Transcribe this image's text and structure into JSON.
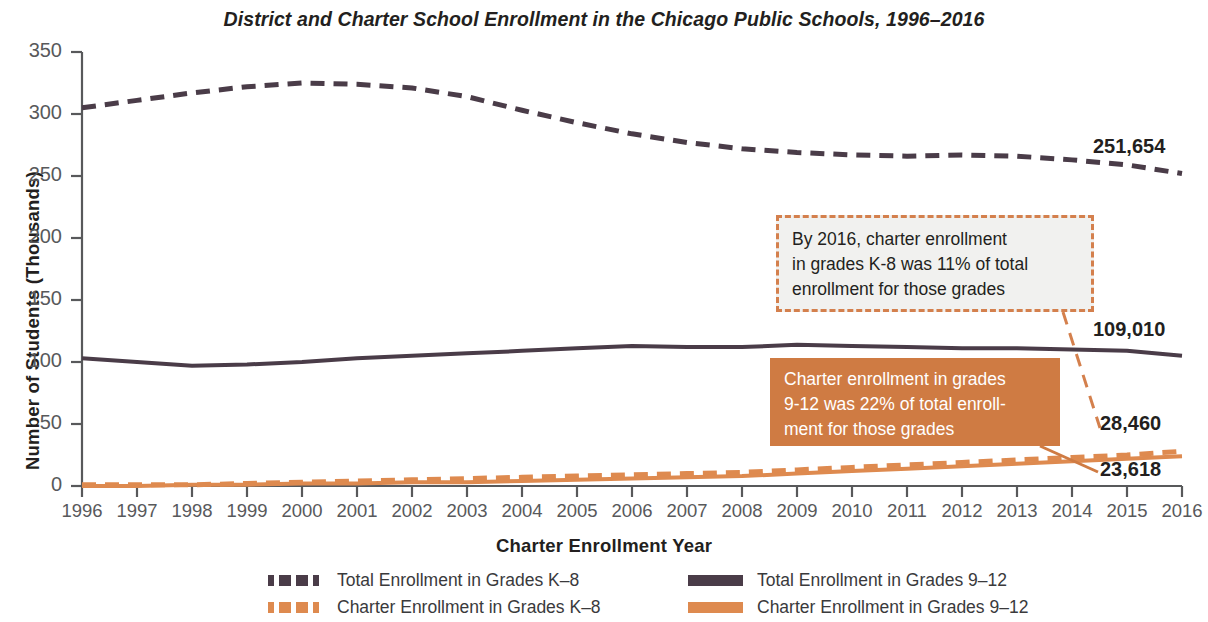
{
  "chart_data": {
    "type": "line",
    "title": "District and Charter School Enrollment in the Chicago Public Schools, 1996–2016",
    "xlabel": "Charter Enrollment Year",
    "ylabel": "Number of Students (Thousands)",
    "xlim": [
      1996,
      2016
    ],
    "ylim": [
      0,
      350
    ],
    "grid": false,
    "legend_position": "bottom",
    "y_ticks": [
      "0",
      "50",
      "100",
      "150",
      "200",
      "250",
      "300",
      "350"
    ],
    "categories": [
      "1996",
      "1997",
      "1998",
      "1999",
      "2000",
      "2001",
      "2002",
      "2003",
      "2004",
      "2005",
      "2006",
      "2007",
      "2008",
      "2009",
      "2010",
      "2011",
      "2012",
      "2013",
      "2014",
      "2015",
      "2016"
    ],
    "series": [
      {
        "name": "Total Enrollment in Grades K-8",
        "style": "dashed",
        "color": "#4a3c48",
        "values": [
          305,
          311,
          317,
          322,
          325,
          324,
          321,
          314,
          303,
          293,
          284,
          277,
          272,
          269,
          267,
          266,
          267,
          266,
          263,
          259,
          252
        ],
        "end_label": "251,654"
      },
      {
        "name": "Total Enrollment in Grades 9-12",
        "style": "solid",
        "color": "#4a3c48",
        "values": [
          103,
          100,
          97,
          98,
          100,
          103,
          105,
          107,
          109,
          111,
          113,
          112,
          112,
          114,
          113,
          112,
          111,
          111,
          110,
          109,
          105
        ],
        "end_label": "109,010"
      },
      {
        "name": "Charter Enrollment in Grades K-8",
        "style": "dashed",
        "color": "#de8a4f",
        "values": [
          1,
          1,
          1,
          2,
          3,
          4,
          5,
          6,
          7,
          8,
          9,
          10,
          11,
          13,
          15,
          17,
          19,
          21,
          23,
          25,
          28
        ],
        "end_label": "28,460"
      },
      {
        "name": "Charter Enrollment in Grades 9-12",
        "style": "solid",
        "color": "#de8a4f",
        "values": [
          0,
          0,
          1,
          1,
          2,
          2,
          3,
          3,
          4,
          5,
          6,
          7,
          8,
          10,
          12,
          14,
          16,
          18,
          20,
          22,
          24
        ],
        "end_label": "23,618"
      }
    ],
    "annotations": [
      {
        "id": "callout-k8",
        "text": "By 2016, charter enrollment in grades K-8 was 11% of total enrollment for those grades",
        "style": "dashed-outline",
        "border_color": "#d4804d",
        "fill_color": "#f1f1ef",
        "text_color": "#231f20"
      },
      {
        "id": "callout-912",
        "text": "Charter enrollment in grades 9-12 was 22% of total enrollment for those grades",
        "style": "solid-fill",
        "fill_color": "#cf7b43",
        "text_color": "#ffffff"
      }
    ]
  },
  "colors": {
    "dark": "#4a3c48",
    "orange": "#de8a4f",
    "orange_deep": "#cf7b43",
    "axis": "#58595b",
    "text": "#231f20",
    "callout_fill": "#f1f1ef"
  },
  "legend": {
    "items": [
      {
        "label": "Total Enrollment in Grades K–8",
        "swatch": "dash-dark"
      },
      {
        "label": "Charter Enrollment in Grades K–8",
        "swatch": "dash-orange"
      },
      {
        "label": "Total Enrollment in Grades 9–12",
        "swatch": "solid-dark"
      },
      {
        "label": "Charter Enrollment in Grades 9–12",
        "swatch": "solid-orange"
      }
    ]
  },
  "end_labels": {
    "total_k8": "251,654",
    "total_912": "109,010",
    "charter_k8": "28,460",
    "charter_912": "23,618"
  },
  "callouts": {
    "k8_line1": "By 2016, charter enrollment",
    "k8_line2": "in grades K-8 was 11% of total",
    "k8_line3": "enrollment for those grades",
    "g912_line1": "Charter enrollment in grades",
    "g912_line2": "9-12 was 22% of total enroll-",
    "g912_line3": "ment for those grades"
  }
}
